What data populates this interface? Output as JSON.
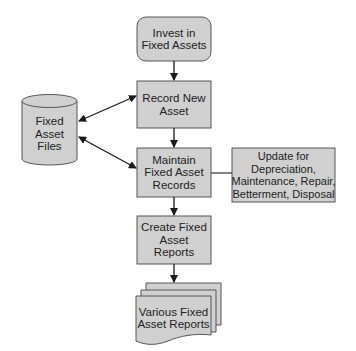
{
  "diagram": {
    "colors": {
      "fill": "#d0d0d0",
      "stroke": "#555555",
      "text": "#222222",
      "arrow": "#1a1a1a"
    },
    "nodes": {
      "start": {
        "label": "Invest in\nFixed Assets",
        "shape": "rounded-rectangle"
      },
      "record": {
        "label": "Record New\nAsset",
        "shape": "rectangle"
      },
      "maintain": {
        "label": "Maintain\nFixed Asset\nRecords",
        "shape": "rectangle"
      },
      "update": {
        "label": "Update for\nDepreciation,\nMaintenance, Repair,\nBetterment, Disposal",
        "shape": "rectangle"
      },
      "create": {
        "label": "Create Fixed\nAsset\nReports",
        "shape": "rectangle"
      },
      "files": {
        "label": "Fixed\nAsset\nFiles",
        "shape": "cylinder"
      },
      "reports": {
        "label": "Various Fixed\nAsset Reports",
        "shape": "multi-document"
      }
    },
    "edges": [
      {
        "from": "start",
        "to": "record",
        "type": "arrow"
      },
      {
        "from": "record",
        "to": "maintain",
        "type": "arrow"
      },
      {
        "from": "maintain",
        "to": "create",
        "type": "arrow"
      },
      {
        "from": "create",
        "to": "reports",
        "type": "arrow"
      },
      {
        "from": "files",
        "to": "record",
        "type": "bidirectional-arrow"
      },
      {
        "from": "files",
        "to": "maintain",
        "type": "bidirectional-arrow"
      },
      {
        "from": "maintain",
        "to": "update",
        "type": "line"
      }
    ]
  }
}
